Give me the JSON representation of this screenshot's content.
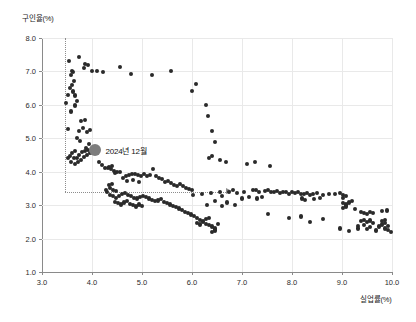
{
  "chart_data": {
    "type": "scatter",
    "title": "",
    "xlabel": "실업률(%)",
    "ylabel": "구인율(%)",
    "xlim": [
      3.0,
      10.0
    ],
    "ylim": [
      1.0,
      8.0
    ],
    "xticks": [
      "3.0",
      "4.0",
      "5.0",
      "6.0",
      "7.0",
      "8.0",
      "9.0",
      "10.0"
    ],
    "yticks": [
      "1.0",
      "2.0",
      "3.0",
      "4.0",
      "5.0",
      "6.0",
      "7.0",
      "8.0"
    ],
    "grid": true,
    "legend": "none",
    "annotations": [
      {
        "label": "2024년 12월",
        "x": 4.05,
        "y": 4.65,
        "marker": "large-gray-circle",
        "marker_color": "#7d7d7d"
      }
    ],
    "reference_lines": [
      {
        "type": "vertical",
        "x": 3.45,
        "y_from": 8.0,
        "y_to": 3.4,
        "style": "dotted"
      },
      {
        "type": "horizontal",
        "y": 3.4,
        "x_from": 3.45,
        "x_to": 6.68,
        "style": "dotted",
        "arrow_end": true
      }
    ],
    "series_name": "월별 실업률-구인율",
    "point_color": "#2a2a2a",
    "points": [
      [
        3.54,
        7.3
      ],
      [
        3.6,
        7.02
      ],
      [
        3.62,
        6.98
      ],
      [
        3.58,
        6.88
      ],
      [
        3.64,
        6.72
      ],
      [
        3.6,
        6.6
      ],
      [
        3.56,
        6.5
      ],
      [
        3.52,
        6.3
      ],
      [
        3.48,
        6.05
      ],
      [
        3.62,
        6.4
      ],
      [
        3.66,
        6.28
      ],
      [
        3.7,
        6.12
      ],
      [
        3.66,
        5.98
      ],
      [
        3.58,
        5.8
      ],
      [
        3.52,
        5.28
      ],
      [
        3.74,
        7.42
      ],
      [
        3.86,
        7.22
      ],
      [
        3.92,
        7.18
      ],
      [
        4.0,
        7.0
      ],
      [
        4.1,
        7.0
      ],
      [
        4.22,
        6.98
      ],
      [
        3.84,
        7.1
      ],
      [
        4.56,
        7.12
      ],
      [
        4.78,
        6.92
      ],
      [
        5.2,
        6.9
      ],
      [
        5.58,
        7.0
      ],
      [
        6.08,
        6.62
      ],
      [
        6.0,
        6.42
      ],
      [
        6.28,
        6.0
      ],
      [
        6.32,
        5.68
      ],
      [
        6.4,
        5.22
      ],
      [
        6.46,
        4.9
      ],
      [
        3.78,
        5.52
      ],
      [
        3.86,
        5.56
      ],
      [
        3.82,
        5.3
      ],
      [
        3.74,
        5.22
      ],
      [
        3.9,
        5.18
      ],
      [
        3.96,
        5.26
      ],
      [
        3.7,
        5.0
      ],
      [
        3.76,
        4.92
      ],
      [
        3.94,
        4.84
      ],
      [
        3.88,
        4.7
      ],
      [
        3.66,
        4.62
      ],
      [
        3.6,
        4.55
      ],
      [
        3.56,
        4.48
      ],
      [
        3.64,
        4.4
      ],
      [
        3.7,
        4.42
      ],
      [
        3.74,
        4.5
      ],
      [
        3.8,
        4.58
      ],
      [
        3.86,
        4.62
      ],
      [
        3.92,
        4.66
      ],
      [
        3.52,
        4.4
      ],
      [
        3.58,
        4.3
      ],
      [
        3.66,
        4.22
      ],
      [
        3.72,
        4.3
      ],
      [
        3.78,
        4.36
      ],
      [
        3.84,
        4.44
      ],
      [
        3.9,
        4.5
      ],
      [
        3.96,
        4.56
      ],
      [
        4.02,
        4.6
      ],
      [
        4.08,
        4.55
      ],
      [
        4.14,
        4.3
      ],
      [
        4.2,
        4.2
      ],
      [
        4.26,
        4.12
      ],
      [
        4.32,
        4.1
      ],
      [
        4.38,
        4.08
      ],
      [
        4.44,
        4.02
      ],
      [
        4.5,
        4.0
      ],
      [
        4.56,
        3.98
      ],
      [
        4.34,
        4.14
      ],
      [
        4.4,
        4.16
      ],
      [
        4.46,
        3.96
      ],
      [
        4.62,
        3.82
      ],
      [
        4.68,
        3.88
      ],
      [
        4.74,
        3.9
      ],
      [
        4.8,
        3.92
      ],
      [
        4.86,
        3.94
      ],
      [
        4.92,
        3.9
      ],
      [
        4.98,
        3.88
      ],
      [
        5.04,
        3.92
      ],
      [
        5.1,
        3.86
      ],
      [
        5.16,
        3.9
      ],
      [
        5.22,
        4.08
      ],
      [
        5.28,
        3.88
      ],
      [
        5.34,
        3.82
      ],
      [
        5.4,
        3.78
      ],
      [
        4.7,
        3.72
      ],
      [
        4.82,
        3.74
      ],
      [
        4.94,
        3.7
      ],
      [
        5.46,
        3.68
      ],
      [
        5.52,
        3.72
      ],
      [
        5.58,
        3.66
      ],
      [
        5.64,
        3.6
      ],
      [
        5.7,
        3.58
      ],
      [
        5.76,
        3.62
      ],
      [
        5.82,
        3.56
      ],
      [
        5.88,
        3.52
      ],
      [
        5.94,
        3.48
      ],
      [
        6.0,
        3.44
      ],
      [
        4.36,
        3.52
      ],
      [
        4.42,
        3.46
      ],
      [
        4.48,
        3.42
      ],
      [
        4.3,
        3.38
      ],
      [
        4.36,
        3.3
      ],
      [
        4.42,
        3.26
      ],
      [
        4.48,
        3.22
      ],
      [
        4.54,
        3.28
      ],
      [
        4.6,
        3.32
      ],
      [
        4.66,
        3.36
      ],
      [
        4.72,
        3.3
      ],
      [
        4.78,
        3.26
      ],
      [
        4.84,
        3.22
      ],
      [
        4.9,
        3.2
      ],
      [
        4.96,
        3.24
      ],
      [
        5.02,
        3.28
      ],
      [
        5.08,
        3.24
      ],
      [
        5.14,
        3.2
      ],
      [
        5.2,
        3.16
      ],
      [
        5.26,
        3.12
      ],
      [
        5.32,
        3.14
      ],
      [
        5.38,
        3.18
      ],
      [
        5.44,
        3.1
      ],
      [
        5.5,
        3.06
      ],
      [
        5.56,
        3.02
      ],
      [
        5.62,
        2.98
      ],
      [
        5.68,
        2.94
      ],
      [
        5.74,
        2.9
      ],
      [
        4.28,
        3.44
      ],
      [
        4.34,
        3.6
      ],
      [
        4.4,
        3.64
      ],
      [
        4.46,
        3.1
      ],
      [
        4.52,
        3.06
      ],
      [
        4.58,
        3.02
      ],
      [
        4.64,
        3.08
      ],
      [
        4.7,
        3.12
      ],
      [
        4.76,
        3.04
      ],
      [
        4.82,
        3.0
      ],
      [
        4.88,
        2.96
      ],
      [
        4.94,
        3.02
      ],
      [
        5.0,
        2.98
      ],
      [
        5.8,
        2.86
      ],
      [
        5.86,
        2.8
      ],
      [
        5.92,
        2.76
      ],
      [
        5.98,
        2.72
      ],
      [
        6.04,
        2.68
      ],
      [
        6.1,
        2.62
      ],
      [
        6.16,
        2.56
      ],
      [
        6.22,
        2.5
      ],
      [
        6.28,
        2.44
      ],
      [
        6.34,
        2.4
      ],
      [
        6.4,
        2.36
      ],
      [
        6.46,
        2.3
      ],
      [
        6.1,
        2.46
      ],
      [
        6.16,
        2.42
      ],
      [
        6.22,
        2.52
      ],
      [
        6.28,
        2.58
      ],
      [
        6.34,
        2.62
      ],
      [
        6.4,
        2.2
      ],
      [
        6.46,
        2.24
      ],
      [
        6.52,
        2.44
      ],
      [
        6.02,
        3.3
      ],
      [
        6.2,
        3.34
      ],
      [
        6.38,
        3.36
      ],
      [
        6.56,
        3.4
      ],
      [
        6.6,
        3.26
      ],
      [
        6.74,
        3.4
      ],
      [
        6.82,
        3.44
      ],
      [
        6.9,
        3.36
      ],
      [
        7.04,
        3.38
      ],
      [
        6.7,
        3.08
      ],
      [
        6.46,
        3.12
      ],
      [
        6.3,
        3.0
      ],
      [
        6.6,
        2.98
      ],
      [
        6.34,
        4.42
      ],
      [
        6.4,
        4.46
      ],
      [
        6.56,
        4.34
      ],
      [
        6.68,
        4.3
      ],
      [
        7.1,
        4.22
      ],
      [
        7.56,
        4.18
      ],
      [
        7.26,
        4.28
      ],
      [
        7.22,
        3.44
      ],
      [
        7.28,
        3.46
      ],
      [
        7.34,
        3.4
      ],
      [
        7.46,
        3.42
      ],
      [
        7.52,
        3.44
      ],
      [
        7.58,
        3.4
      ],
      [
        7.64,
        3.38
      ],
      [
        7.7,
        3.42
      ],
      [
        7.76,
        3.36
      ],
      [
        7.82,
        3.4
      ],
      [
        7.88,
        3.38
      ],
      [
        7.94,
        3.34
      ],
      [
        8.0,
        3.38
      ],
      [
        8.06,
        3.36
      ],
      [
        8.12,
        3.4
      ],
      [
        8.18,
        3.34
      ],
      [
        8.24,
        3.32
      ],
      [
        8.3,
        3.36
      ],
      [
        8.36,
        3.3
      ],
      [
        8.42,
        3.34
      ],
      [
        8.5,
        3.36
      ],
      [
        8.62,
        3.3
      ],
      [
        8.74,
        3.32
      ],
      [
        8.86,
        3.34
      ],
      [
        7.3,
        3.2
      ],
      [
        7.4,
        3.24
      ],
      [
        8.2,
        3.2
      ],
      [
        8.26,
        3.16
      ],
      [
        8.56,
        3.22
      ],
      [
        8.44,
        3.18
      ],
      [
        7.0,
        3.2
      ],
      [
        7.14,
        3.24
      ],
      [
        6.86,
        3.0
      ],
      [
        7.52,
        2.74
      ],
      [
        7.94,
        2.62
      ],
      [
        8.18,
        2.66
      ],
      [
        8.62,
        2.58
      ],
      [
        8.36,
        2.5
      ],
      [
        8.96,
        3.36
      ],
      [
        9.02,
        3.3
      ],
      [
        9.02,
        3.22
      ],
      [
        9.08,
        3.26
      ],
      [
        9.02,
        3.06
      ],
      [
        9.08,
        3.02
      ],
      [
        9.14,
        3.08
      ],
      [
        9.08,
        2.96
      ],
      [
        9.02,
        2.92
      ],
      [
        9.2,
        3.12
      ],
      [
        9.26,
        2.88
      ],
      [
        9.38,
        2.8
      ],
      [
        9.44,
        2.76
      ],
      [
        9.5,
        2.74
      ],
      [
        9.56,
        2.8
      ],
      [
        9.62,
        2.76
      ],
      [
        9.38,
        2.52
      ],
      [
        9.44,
        2.56
      ],
      [
        9.5,
        2.5
      ],
      [
        9.56,
        2.54
      ],
      [
        9.62,
        2.46
      ],
      [
        9.44,
        2.4
      ],
      [
        9.56,
        2.34
      ],
      [
        9.32,
        2.38
      ],
      [
        9.8,
        2.82
      ],
      [
        9.9,
        2.84
      ],
      [
        9.8,
        2.52
      ],
      [
        9.86,
        2.56
      ],
      [
        9.8,
        2.42
      ],
      [
        9.86,
        2.46
      ],
      [
        9.92,
        2.38
      ],
      [
        9.86,
        2.3
      ],
      [
        9.92,
        2.26
      ],
      [
        9.98,
        2.2
      ],
      [
        9.74,
        2.36
      ],
      [
        8.96,
        2.3
      ],
      [
        9.14,
        2.22
      ],
      [
        9.32,
        2.3
      ],
      [
        9.5,
        2.28
      ],
      [
        9.68,
        2.24
      ]
    ]
  }
}
